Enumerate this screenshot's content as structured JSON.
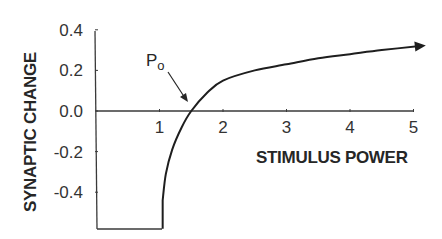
{
  "chart_data": {
    "type": "line",
    "title": "",
    "xlabel": "STIMULUS POWER",
    "ylabel": "SYNAPTIC CHANGE",
    "xlim": [
      0,
      5
    ],
    "ylim": [
      -0.58,
      0.4
    ],
    "x_ticks": [
      "1",
      "2",
      "3",
      "4",
      "5"
    ],
    "x_tick_values": [
      1,
      2,
      3,
      4,
      5
    ],
    "y_ticks": [
      "0.4",
      "0.2",
      "0.0",
      "-0.2",
      "-0.4"
    ],
    "y_tick_values": [
      0.4,
      0.2,
      0.0,
      -0.2,
      -0.4
    ],
    "grid": false,
    "legend": null,
    "series": [
      {
        "name": "synaptic change vs stimulus power",
        "x": [
          0.0,
          1.05,
          1.05,
          1.1,
          1.2,
          1.35,
          1.5,
          1.75,
          2.0,
          2.5,
          3.0,
          3.5,
          4.0,
          4.5,
          5.1
        ],
        "y": [
          -0.58,
          -0.58,
          -0.44,
          -0.31,
          -0.19,
          -0.08,
          0.0,
          0.09,
          0.15,
          0.2,
          0.23,
          0.26,
          0.28,
          0.3,
          0.32
        ]
      }
    ],
    "annotations": [
      {
        "text": "P",
        "subscript": "o",
        "points_to": {
          "x": 1.5,
          "y": 0.0
        }
      }
    ]
  }
}
